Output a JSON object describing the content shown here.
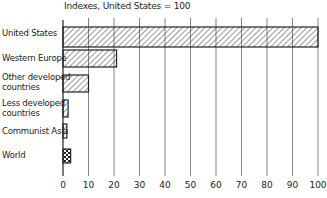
{
  "chart_data": {
    "type": "bar",
    "orientation": "horizontal",
    "title": "Indexes, United States = 100",
    "xlabel": "",
    "ylabel": "",
    "categories": [
      "United States",
      "Western Europe",
      "Other developed countries",
      "Less developed countries",
      "Communist Asia",
      "World"
    ],
    "values": [
      100,
      21,
      10,
      2,
      1.5,
      3
    ],
    "xlim": [
      0,
      100
    ],
    "xticks": [
      0,
      10,
      20,
      30,
      40,
      50,
      60,
      70,
      80,
      90,
      100
    ],
    "grid": "vertical lines at each tick",
    "patterns": [
      "diagonal-hatch",
      "diagonal-hatch",
      "diagonal-hatch",
      "diagonal-hatch",
      "diagonal-hatch",
      "checkered"
    ]
  },
  "labels": {
    "title": "Indexes, United States = 100",
    "cat0": "United States",
    "cat1": "Western Europe",
    "cat2a": "Other developed",
    "cat2b": "countries",
    "cat3a": "Less developed",
    "cat3b": "countries",
    "cat4": "Communist Asia",
    "cat5": "World",
    "ticks": [
      "0",
      "10",
      "20",
      "30",
      "40",
      "50",
      "60",
      "70",
      "80",
      "90",
      "100"
    ]
  }
}
